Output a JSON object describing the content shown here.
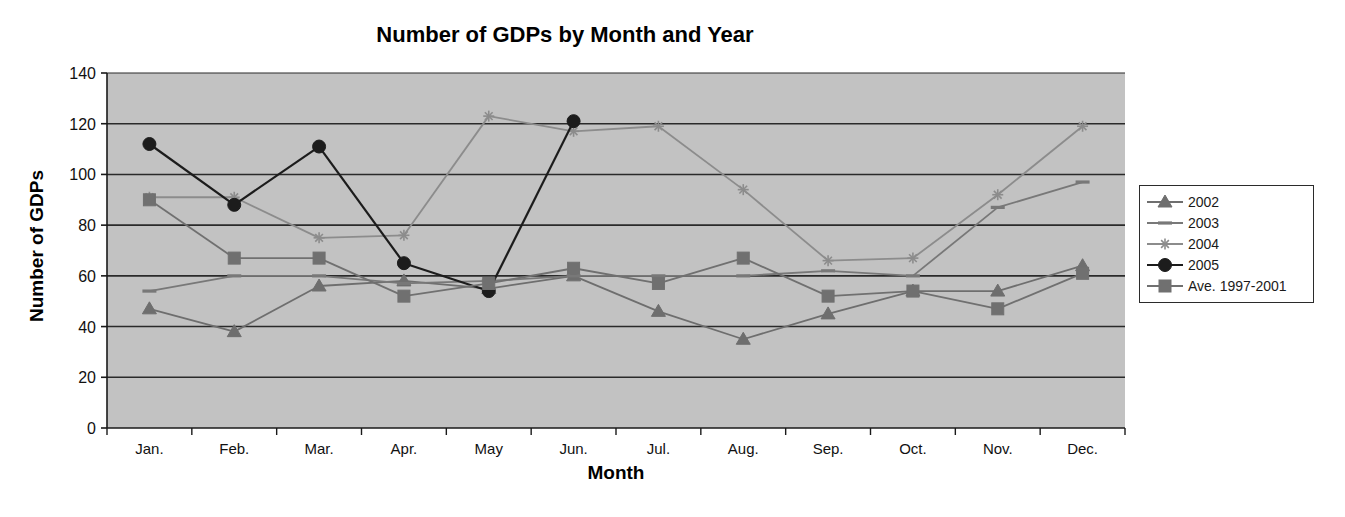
{
  "chart_data": {
    "type": "line",
    "title": "Number of GDPs by Month and Year",
    "xlabel": "Month",
    "ylabel": "Number of GDPs",
    "categories": [
      "Jan.",
      "Feb.",
      "Mar.",
      "Apr.",
      "May",
      "Jun.",
      "Jul.",
      "Aug.",
      "Sep.",
      "Oct.",
      "Nov.",
      "Dec."
    ],
    "ylim": [
      0,
      140
    ],
    "yticks": [
      0,
      20,
      40,
      60,
      80,
      100,
      120,
      140
    ],
    "ytick_labels": [
      "0",
      "20",
      "40",
      "60",
      "80",
      "100",
      "120",
      "140"
    ],
    "grid": true,
    "grid_axis": "y",
    "legend_position": "right",
    "plot_background": "#c2c2c2",
    "series": [
      {
        "name": "2002",
        "marker": "triangle",
        "color": "#6e6e6e",
        "values": [
          47,
          38,
          56,
          58,
          55,
          60,
          46,
          35,
          45,
          54,
          54,
          64
        ]
      },
      {
        "name": "2003",
        "marker": "dash",
        "color": "#787878",
        "values": [
          54,
          60,
          60,
          57,
          58,
          60,
          60,
          60,
          62,
          60,
          87,
          97
        ]
      },
      {
        "name": "2004",
        "marker": "star",
        "color": "#8c8c8c",
        "values": [
          91,
          91,
          75,
          76,
          123,
          117,
          119,
          94,
          66,
          67,
          92,
          119
        ]
      },
      {
        "name": "2005",
        "marker": "circle",
        "color": "#1c1c1c",
        "values": [
          112,
          88,
          111,
          65,
          54,
          121,
          null,
          null,
          null,
          null,
          null,
          null
        ]
      },
      {
        "name": "Ave. 1997-2001",
        "marker": "square",
        "color": "#707070",
        "values": [
          90,
          67,
          67,
          52,
          57,
          63,
          57,
          67,
          52,
          54,
          47,
          61
        ]
      }
    ]
  }
}
